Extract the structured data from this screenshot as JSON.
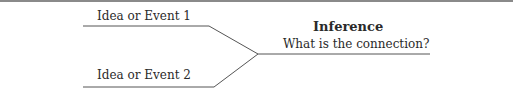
{
  "diagram": {
    "idea1": "Idea or Event 1",
    "idea2": "Idea or Event 2",
    "title": "Inference",
    "question": "What is the connection?"
  },
  "colors": {
    "line": "#555555",
    "border": "#8a8a8a",
    "text": "#2a2a2a"
  }
}
